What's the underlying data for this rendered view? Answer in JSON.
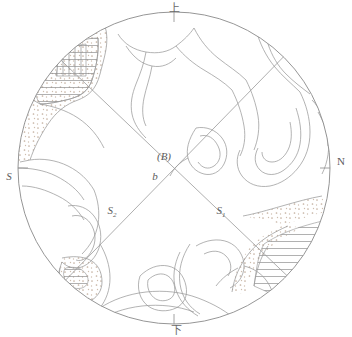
{
  "diagram": {
    "type": "stereographic-fabric-projection",
    "title_visible": false,
    "colors": {
      "outline": "#8a8a8a",
      "contour": "#9a9a9a",
      "girdle": "#9a9a9a",
      "hatch": "#8f8f8f",
      "stipple": "#c8b8a8",
      "label": "#5c5c5c",
      "background": "#ffffff"
    },
    "circle": {
      "cx": 174,
      "cy": 168,
      "r": 156
    },
    "cardinal_labels": [
      {
        "id": "top",
        "text": "上",
        "x": 174,
        "y": 11
      },
      {
        "id": "bottom",
        "text": "下",
        "x": 176,
        "y": 331
      },
      {
        "id": "left",
        "text": "S",
        "x": 9,
        "y": 176
      },
      {
        "id": "right",
        "text": "N",
        "x": 340,
        "y": 161
      }
    ],
    "interior_labels": [
      {
        "id": "b-axis-bracket",
        "text": "(B)",
        "x": 165,
        "y": 158
      },
      {
        "id": "b-axis",
        "text": "b",
        "x": 155,
        "y": 177
      },
      {
        "id": "girdle-s2",
        "text": "S",
        "sub": "2",
        "x": 112,
        "y": 212
      },
      {
        "id": "girdle-s1",
        "text": "S",
        "sub": "1",
        "x": 221,
        "y": 212
      }
    ],
    "girdles": [
      {
        "id": "s1",
        "label": "S1",
        "x1": 52,
        "y1": 52,
        "x2": 288,
        "y2": 276
      },
      {
        "id": "s2",
        "label": "S2",
        "x1": 62,
        "y1": 282,
        "x2": 282,
        "y2": 57
      }
    ],
    "legend_patterns": [
      {
        "id": "horizontal-hatch",
        "description": "horizontal line hatching"
      },
      {
        "id": "vertical-hatch",
        "description": "vertical line hatching"
      },
      {
        "id": "stipple",
        "description": "dotted stipple fill"
      }
    ]
  }
}
